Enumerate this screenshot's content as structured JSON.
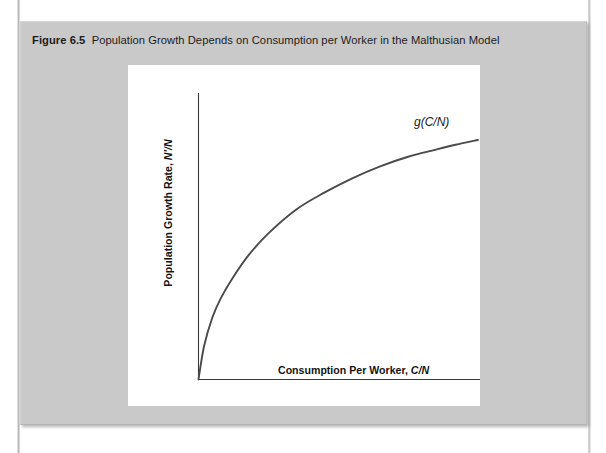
{
  "figure": {
    "label": "Figure 6.5",
    "caption": "Population Growth Depends on Consumption per Worker in the Malthusian Model",
    "box_color": "#c9c9c9",
    "panel_color": "#ffffff"
  },
  "chart_data": {
    "type": "line",
    "title": "Population Growth Depends on Consumption per Worker in the Malthusian Model",
    "xlabel_plain": "Consumption Per Worker,",
    "xlabel_math": "C/N",
    "ylabel_plain": "Population Growth Rate,",
    "ylabel_math": "N′/N",
    "series": [
      {
        "name": "g(C/N)",
        "annotation": "g(C/N)",
        "description": "Increasing concave curve starting at origin, rising steeply then flattening",
        "x": [
          0.0,
          0.02,
          0.05,
          0.08,
          0.12,
          0.18,
          0.25,
          0.35,
          0.45,
          0.55,
          0.65,
          0.75,
          0.85,
          0.92,
          1.0
        ],
        "y": [
          0.0,
          0.14,
          0.26,
          0.34,
          0.42,
          0.52,
          0.61,
          0.71,
          0.78,
          0.84,
          0.89,
          0.93,
          0.96,
          0.98,
          1.0
        ]
      }
    ],
    "xlim": [
      0,
      1
    ],
    "ylim": [
      0,
      1
    ],
    "grid": false,
    "ticks": false,
    "legend": "none",
    "axis_color": "#3a3a3a",
    "curve_color": "#4a4a4a"
  }
}
